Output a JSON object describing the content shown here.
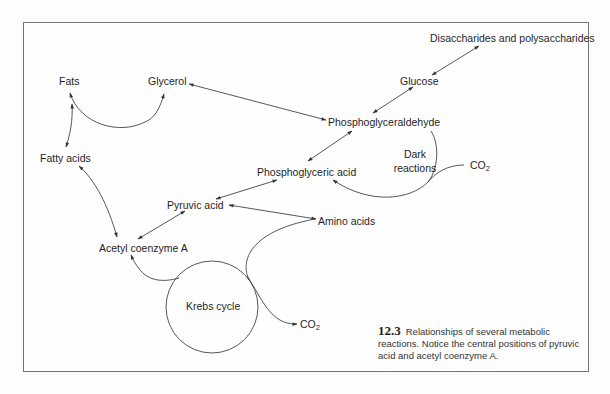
{
  "figure": {
    "number": "12.3",
    "caption": "Relationships of several metabolic reactions. Notice the central positions of pyruvic acid and acetyl coenzyme A."
  },
  "nodes": {
    "disaccharides": "Disaccharides and polysaccharides",
    "glucose": "Glucose",
    "glycerol": "Glycerol",
    "fats": "Fats",
    "fatty_acids": "Fatty acids",
    "phosphoglyceraldehyde": "Phosphoglyceraldehyde",
    "dark_reactions_line1": "Dark",
    "dark_reactions_line2": "reactions",
    "co2_top": "CO",
    "co2_top_sub": "2",
    "phosphoglyceric_acid": "Phosphoglyceric acid",
    "pyruvic_acid": "Pyruvic acid",
    "amino_acids": "Amino acids",
    "acetyl_coa": "Acetyl coenzyme A",
    "krebs_cycle": "Krebs cycle",
    "co2_bottom": "CO",
    "co2_bottom_sub": "2"
  },
  "edges": [
    {
      "from": "Disaccharides and polysaccharides",
      "to": "Glucose",
      "type": "bidirectional"
    },
    {
      "from": "Glucose",
      "to": "Phosphoglyceraldehyde",
      "type": "bidirectional"
    },
    {
      "from": "Glycerol",
      "to": "Phosphoglyceraldehyde",
      "type": "bidirectional"
    },
    {
      "from": "Fats",
      "to": "Glycerol",
      "type": "bidirectional-curve"
    },
    {
      "from": "Fats",
      "to": "Fatty acids",
      "type": "bidirectional"
    },
    {
      "from": "Fatty acids",
      "to": "Acetyl coenzyme A",
      "type": "bidirectional"
    },
    {
      "from": "Phosphoglyceraldehyde",
      "to": "Phosphoglyceric acid",
      "type": "bidirectional"
    },
    {
      "from": "CO2",
      "to": "Phosphoglyceric acid",
      "type": "dark-reactions-cycle"
    },
    {
      "from": "Phosphoglyceric acid",
      "to": "Pyruvic acid",
      "type": "bidirectional"
    },
    {
      "from": "Pyruvic acid",
      "to": "Amino acids",
      "type": "bidirectional"
    },
    {
      "from": "Pyruvic acid",
      "to": "Acetyl coenzyme A",
      "type": "bidirectional"
    },
    {
      "from": "Acetyl coenzyme A",
      "to": "Krebs cycle",
      "type": "cycle-entry"
    },
    {
      "from": "Krebs cycle",
      "to": "Amino acids",
      "type": "curve"
    },
    {
      "from": "Krebs cycle",
      "to": "CO2",
      "type": "output"
    }
  ]
}
